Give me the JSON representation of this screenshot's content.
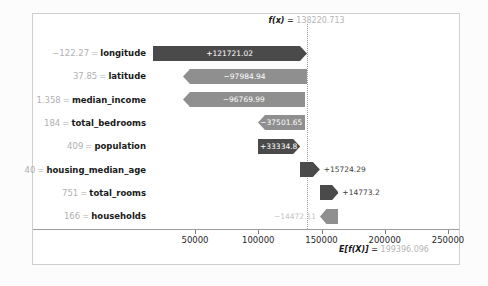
{
  "chart_data": {
    "type": "bar",
    "subtype": "shap-waterfall",
    "title": "",
    "xlabel": "",
    "ylabel": "",
    "xlim": [
      18000,
      268000
    ],
    "xticks": [
      50000,
      100000,
      150000,
      200000,
      250000
    ],
    "xticklabels": [
      "50000",
      "100000",
      "150000",
      "200000",
      "250000"
    ],
    "grid": false,
    "legend": "none",
    "base_value": 199396.096,
    "base_value_label": "E[f(X)]",
    "base_value_text": "199396.096",
    "base_value_eq": "=",
    "prediction_value": 138220.713,
    "prediction_label": "f(x)",
    "prediction_text": "138220.713",
    "prediction_eq": "=",
    "categories": [
      "longitude",
      "latitude",
      "median_income",
      "total_bedrooms",
      "population",
      "housing_median_age",
      "total_rooms",
      "households"
    ],
    "feature_values": [
      "−122.27",
      "37.85",
      "1.358",
      "184",
      "409",
      "40",
      "751",
      "166"
    ],
    "equals_sign": "=",
    "values": [
      121721.02,
      -97984.94,
      -96769.99,
      -37501.65,
      33334.8,
      15724.29,
      14773.2,
      -14472.11
    ],
    "value_labels": [
      "+121721.02",
      "−97984.94",
      "−96769.99",
      "−37501.65",
      "+33334.8",
      "+15724.29",
      "+14773.2",
      "−14472.11"
    ],
    "bar_starts": [
      16499.693,
      138220.713,
      40235.773,
      137005.763,
      99504.113,
      132838.913,
      148563.203,
      163336.403
    ],
    "bar_ends": [
      138220.713,
      40235.773,
      137005.763,
      99504.113,
      132838.913,
      148563.203,
      163336.403,
      148864.293
    ],
    "label_placement": [
      "inside",
      "inside",
      "inside",
      "inside",
      "inside",
      "outside-right",
      "outside-right",
      "outside-left"
    ],
    "colors": {
      "positive": "#4a4a4a",
      "negative": "#8f8f8f",
      "axis": "#9d9d9d",
      "frame": "#cfcfcf",
      "text_dark": "#1a1a1a",
      "text_muted": "#b0b0b0",
      "background": "#ffffff",
      "page_background": "#fcfcfc",
      "reference_line": "#9a9a9a"
    }
  }
}
